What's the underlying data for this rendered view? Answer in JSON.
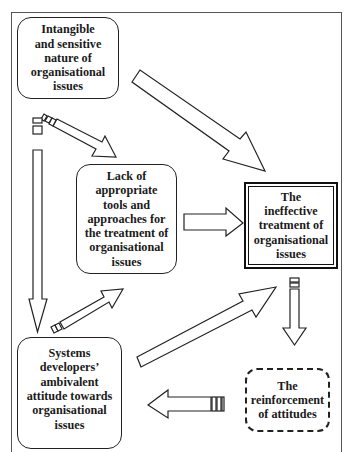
{
  "diagram": {
    "type": "causal-flow",
    "boxes": {
      "intangible": {
        "label": "Intangible and sensitive nature of organisational issues",
        "lines": [
          "Intangible",
          "and sensitive",
          "nature of",
          "organisational",
          "issues"
        ],
        "style": "rounded-solid"
      },
      "lack_of_tools": {
        "label": "Lack of appropriate tools and approaches for the treatment of organisational issues",
        "lines": [
          "Lack of",
          "appropriate",
          "tools and",
          "approaches for",
          "the treatment of",
          "organisational",
          "issues"
        ],
        "style": "rounded-solid"
      },
      "ineffective_treatment": {
        "label": "The ineffective treatment of organisational issues",
        "lines": [
          "The",
          "ineffective",
          "treatment of",
          "organisational",
          "issues"
        ],
        "style": "double-border"
      },
      "ambivalent_attitude": {
        "label": "Systems developers' ambivalent attitude towards organisational issues",
        "lines": [
          "Systems",
          "developers’",
          "ambivalent",
          "attitude towards",
          "organisational",
          "issues"
        ],
        "style": "rounded-solid"
      },
      "reinforcement": {
        "label": "The reinforcement of attitudes",
        "lines": [
          "The",
          "reinforcement",
          "of attitudes"
        ],
        "style": "rounded-dashed"
      }
    },
    "edges": [
      {
        "from": "intangible",
        "to": "ineffective_treatment"
      },
      {
        "from": "intangible",
        "to": "lack_of_tools"
      },
      {
        "from": "intangible",
        "to": "ambivalent_attitude"
      },
      {
        "from": "lack_of_tools",
        "to": "ineffective_treatment"
      },
      {
        "from": "ambivalent_attitude",
        "to": "lack_of_tools"
      },
      {
        "from": "ambivalent_attitude",
        "to": "ineffective_treatment"
      },
      {
        "from": "ineffective_treatment",
        "to": "reinforcement"
      },
      {
        "from": "reinforcement",
        "to": "ambivalent_attitude"
      }
    ],
    "colors": {
      "stroke": "#222222",
      "fill": "#ffffff",
      "text": "#1a1a1a"
    }
  }
}
